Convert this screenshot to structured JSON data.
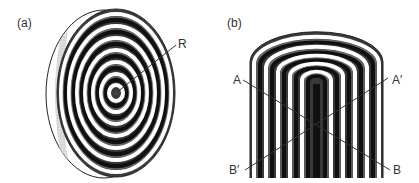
{
  "panels": [
    {
      "id": "a",
      "label": "(a)",
      "title": "Concentric ring disk (circular cross-section)",
      "marker_label": "R"
    },
    {
      "id": "b",
      "label": "(b)",
      "title": "Nested U-shaped layers (longitudinal section)",
      "line_labels": {
        "a_start": "A",
        "a_end": "A′",
        "b_start": "B′",
        "b_end": "B"
      }
    }
  ],
  "colors": {
    "dark": "#1a1a1a",
    "mid": "#777777",
    "light": "#ffffff",
    "line": "#333333"
  }
}
